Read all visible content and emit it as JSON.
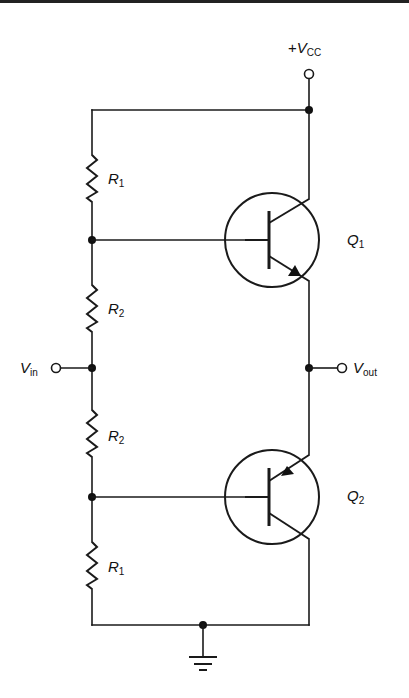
{
  "diagram": {
    "type": "circuit-schematic",
    "supply": {
      "prefix": "+",
      "symbol": "V",
      "subscript": "CC"
    },
    "input": {
      "symbol": "V",
      "subscript": "in"
    },
    "output": {
      "symbol": "V",
      "subscript": "out"
    },
    "resistors": [
      {
        "id": "R1_top",
        "symbol": "R",
        "subscript": "1"
      },
      {
        "id": "R2_upper",
        "symbol": "R",
        "subscript": "2"
      },
      {
        "id": "R2_lower",
        "symbol": "R",
        "subscript": "2"
      },
      {
        "id": "R1_bottom",
        "symbol": "R",
        "subscript": "1"
      }
    ],
    "transistors": [
      {
        "id": "Q1",
        "symbol": "Q",
        "subscript": "1",
        "type": "NPN"
      },
      {
        "id": "Q2",
        "symbol": "Q",
        "subscript": "2",
        "type": "PNP"
      }
    ],
    "ground": "ground-symbol",
    "colors": {
      "ink": "#1a1a1a",
      "background": "#ffffff"
    }
  }
}
